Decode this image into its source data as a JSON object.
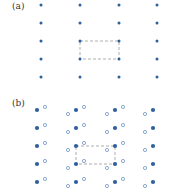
{
  "panels": [
    {
      "label": "(a)",
      "label_pos": [
        12,
        2
      ],
      "filled_color": "#2f5f9e",
      "cols": [
        41,
        80,
        119,
        157
      ],
      "rows": [
        5,
        23,
        41,
        59,
        77
      ],
      "cell": {
        "x1": 80,
        "y1": 41,
        "x2": 119,
        "y2": 59
      },
      "open_offsets": []
    },
    {
      "label": "(b)",
      "label_pos": [
        12,
        99
      ],
      "filled_color": "#2f5f9e",
      "open_color": "#6f93c4",
      "cols": [
        37,
        76,
        115,
        153
      ],
      "rows": [
        110,
        128,
        146,
        164,
        182
      ],
      "cell": {
        "x1": 76,
        "y1": 146,
        "x2": 115,
        "y2": 164
      },
      "open_offsets": [
        {
          "dx": 8,
          "dy": -3
        },
        {
          "dx": -8,
          "dy": 4
        }
      ],
      "open_rules": {
        "col0": [
          "right"
        ],
        "col1": [
          "left",
          "right"
        ],
        "col2": [
          "left",
          "right"
        ],
        "col3": [
          "left"
        ]
      }
    }
  ],
  "dash_color": "#9a9a9a"
}
